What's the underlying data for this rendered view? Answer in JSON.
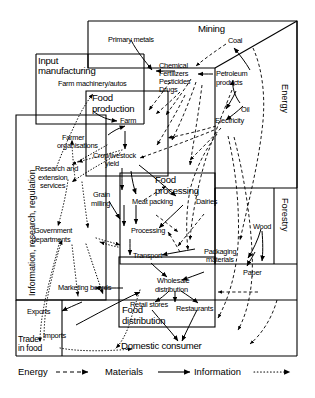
{
  "diagram": {
    "sectors": [
      {
        "id": "mining",
        "label": "Mining"
      },
      {
        "id": "input-manufacturing",
        "label": "Input\nmanufacturing"
      },
      {
        "id": "food-production",
        "label": "Food\nproduction"
      },
      {
        "id": "information-research-regulation",
        "label": "Information, research, regulation"
      },
      {
        "id": "food-processing",
        "label": "Food\nprocessing"
      },
      {
        "id": "food-distribution",
        "label": "Food\ndistribution"
      },
      {
        "id": "energy",
        "label": "Energy"
      },
      {
        "id": "forestry",
        "label": "Forestry"
      },
      {
        "id": "trade-in-food",
        "label": "Trade\nin food"
      }
    ],
    "nodes": [
      {
        "id": "primary-metals",
        "label": "Primary metals"
      },
      {
        "id": "coal",
        "label": "Coal"
      },
      {
        "id": "farm-machinery-autos",
        "label": "Farm machinery/autos"
      },
      {
        "id": "chemical-fertilizers-pesticides-drugs",
        "label": "Chemical\nFertilizers\nPesticides\nDrugs"
      },
      {
        "id": "petroleum-products",
        "label": "Petroleum\nproducts"
      },
      {
        "id": "oil",
        "label": "Oil"
      },
      {
        "id": "electricity",
        "label": "Electricity"
      },
      {
        "id": "farm",
        "label": "Farm"
      },
      {
        "id": "farmer-organisations",
        "label": "Farmer\norganisations"
      },
      {
        "id": "crop-livestock-yield",
        "label": "Crop/livestock\nyield"
      },
      {
        "id": "research-extension-services",
        "label": "Research and\nextension\nservices"
      },
      {
        "id": "government-departments",
        "label": "Government\ndepartments"
      },
      {
        "id": "grain-milling",
        "label": "Grain\nmilling"
      },
      {
        "id": "meat-packing",
        "label": "Meat packing"
      },
      {
        "id": "dairies",
        "label": "Dairies"
      },
      {
        "id": "processing",
        "label": "Processing"
      },
      {
        "id": "transport",
        "label": "Transport"
      },
      {
        "id": "packaging-materials",
        "label": "Packaging\nmaterials"
      },
      {
        "id": "wood",
        "label": "Wood"
      },
      {
        "id": "paper",
        "label": "Paper"
      },
      {
        "id": "marketing-boards",
        "label": "Marketing boards"
      },
      {
        "id": "wholesale-distribution",
        "label": "Wholesale\ndistribution"
      },
      {
        "id": "retail-stores",
        "label": "Retail stores"
      },
      {
        "id": "restaurants",
        "label": "Restaurants"
      },
      {
        "id": "exports",
        "label": "Exports"
      },
      {
        "id": "imports",
        "label": "Imports"
      },
      {
        "id": "domestic-consumer",
        "label": "Domestic consumer"
      }
    ],
    "labels": {
      "mining": "Mining",
      "input_manufacturing_l1": "Input",
      "input_manufacturing_l2": "manufacturing",
      "food_production_l1": "Food",
      "food_production_l2": "production",
      "food_processing_l1": "Food",
      "food_processing_l2": "processing",
      "food_distribution_l1": "Food",
      "food_distribution_l2": "distribution",
      "information_research_regulation": "Information, research, regulation",
      "energy": "Energy",
      "forestry": "Forestry",
      "trade_l1": "Trade",
      "trade_l2": "in food",
      "primary_metals": "Primary metals",
      "coal": "Coal",
      "farm_machinery_autos": "Farm machinery/autos",
      "chem_l1": "Chemical",
      "chem_l2": "Fertilizers",
      "chem_l3": "Pesticides",
      "chem_l4": "Drugs",
      "petroleum_l1": "Petroleum",
      "petroleum_l2": "products",
      "oil": "Oil",
      "electricity": "Electricity",
      "farm": "Farm",
      "farmer_org_l1": "Farmer",
      "farmer_org_l2": "organisations",
      "crop_yield_l1": "Crop/livestock",
      "crop_yield_l2": "yield",
      "research_l1": "Research and",
      "research_l2": "extension",
      "research_l3": "services",
      "government_l1": "Government",
      "government_l2": "departments",
      "grain_l1": "Grain",
      "grain_l2": "milling",
      "meat_packing": "Meat packing",
      "dairies": "Dairies",
      "processing": "Processing",
      "transport": "Transport",
      "packaging_l1": "Packaging",
      "packaging_l2": "materials",
      "wood": "Wood",
      "paper": "Paper",
      "marketing_boards": "Marketing boards",
      "wholesale_l1": "Wholesale",
      "wholesale_l2": "distribution",
      "retail_stores": "Retail stores",
      "restaurants": "Restaurants",
      "exports": "Exports",
      "imports": "Imports",
      "domestic_consumer": "Domestic consumer"
    },
    "legend": {
      "items": [
        {
          "id": "energy",
          "label": "Energy",
          "line": "dashed"
        },
        {
          "id": "materials",
          "label": "Materials",
          "line": "solid"
        },
        {
          "id": "information",
          "label": "Information",
          "line": "dotted"
        }
      ]
    },
    "colors": {
      "stroke": "#000000",
      "background": "#ffffff"
    }
  }
}
